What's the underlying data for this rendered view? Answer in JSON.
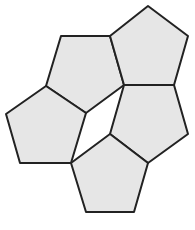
{
  "diagram": {
    "fill": "#e6e6e6",
    "stroke": "#222222",
    "stroke_width": 2,
    "background": "#ffffff",
    "shapes": [
      {
        "id": "pentagon-top-left",
        "points": "61,36 110,36 124,85 86,113 46,86"
      },
      {
        "id": "pentagon-top-right",
        "points": "148,6 188,36 174,85 124,85 110,36"
      },
      {
        "id": "pentagon-middle-left",
        "points": "46,86 86,113 71,163 20,163 6,114"
      },
      {
        "id": "pentagon-middle-right",
        "points": "124,85 174,85 188,134 148,163 110,134"
      },
      {
        "id": "pentagon-bottom",
        "points": "110,134 148,163 134,212 86,212 71,163"
      }
    ]
  }
}
